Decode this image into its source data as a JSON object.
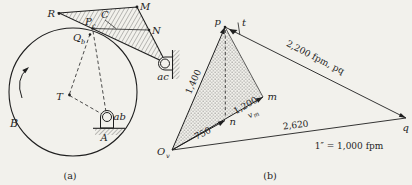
{
  "colors": {
    "paper": "#f2f1ec",
    "ink": "#1f1f1f"
  },
  "part_a": {
    "caption": "(a)",
    "labels": {
      "R": "R",
      "M": "M",
      "N": "N",
      "C": "C",
      "T": "T",
      "B": "B",
      "A": "A",
      "ab": "ab",
      "ac": "ac",
      "P": {
        "main": "P",
        "sub": "c"
      },
      "Q": {
        "main": "Q",
        "sub": "b"
      }
    }
  },
  "part_b": {
    "caption": "(b)",
    "labels": {
      "O": {
        "main": "O",
        "sub": "v"
      },
      "p": "p",
      "t": "t",
      "n": "n",
      "m": "m",
      "q": "q",
      "v": {
        "main": "v",
        "sub": "m"
      }
    },
    "values": {
      "op": "1,400",
      "on": "750",
      "om": "1,200",
      "pq": "2,200 fpm, pq",
      "oq": "2,620",
      "scale": "1″ = 1,000 fpm"
    }
  }
}
